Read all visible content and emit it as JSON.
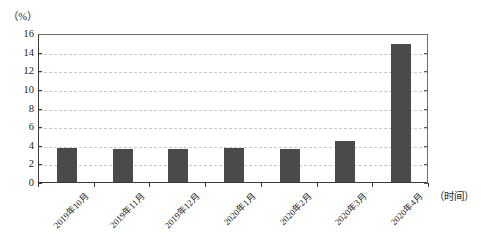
{
  "chart_data": {
    "type": "bar",
    "title": "",
    "subtitle": "",
    "xlabel": "（时间）",
    "ylabel": "（%）",
    "categories": [
      "2019年10月",
      "2019年11月",
      "2019年12月",
      "2020年1月",
      "2020年2月",
      "2020年3月",
      "2020年4月"
    ],
    "values": [
      3.6,
      3.5,
      3.5,
      3.6,
      3.5,
      4.4,
      14.8
    ],
    "series": [
      {
        "name": "",
        "values": [
          3.6,
          3.5,
          3.5,
          3.6,
          3.5,
          4.4,
          14.8
        ]
      }
    ],
    "ylim": [
      0,
      16
    ],
    "ytick_labels": [
      "16",
      "14",
      "12",
      "10",
      "8",
      "6",
      "4",
      "2",
      "0"
    ],
    "ytick_values": [
      16,
      14,
      12,
      10,
      8,
      6,
      4,
      2,
      0
    ],
    "ytick_step": 2,
    "grid": true,
    "grid_axis": "y",
    "grid_style": "dashed",
    "legend": false,
    "legend_position": "none",
    "bar_color": "#4a4a4a",
    "grid_color": "#c9c9c9",
    "axis_color": "#3a3a3a",
    "background_color": "#ffffff",
    "x_label_rotation": -45
  }
}
